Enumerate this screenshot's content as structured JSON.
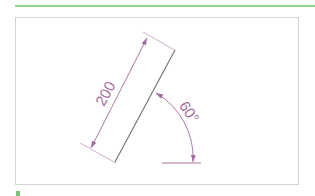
{
  "colors": {
    "rule_green": "#8fd38a",
    "frame_border": "#d4d4d4",
    "dimension": "#a06a9e",
    "object_line": "#707070",
    "corner_mark": "#7cc47a"
  },
  "diagram": {
    "length_dimension": {
      "label": "200",
      "units": "mm"
    },
    "angle_dimension": {
      "label": "60°",
      "degrees": 60
    }
  }
}
